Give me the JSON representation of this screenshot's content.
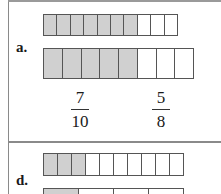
{
  "problems": [
    {
      "label": "a.",
      "bars": [
        {
          "cells": 10,
          "shaded": 7
        },
        {
          "cells": 8,
          "shaded": 5
        }
      ],
      "fractions": [
        {
          "numerator": "7",
          "denominator": "10"
        },
        {
          "numerator": "5",
          "denominator": "8"
        }
      ]
    },
    {
      "label": "d.",
      "bars": [
        {
          "cells": 10,
          "shaded": 3
        },
        {
          "cells": 4,
          "shaded": 1
        }
      ]
    }
  ]
}
